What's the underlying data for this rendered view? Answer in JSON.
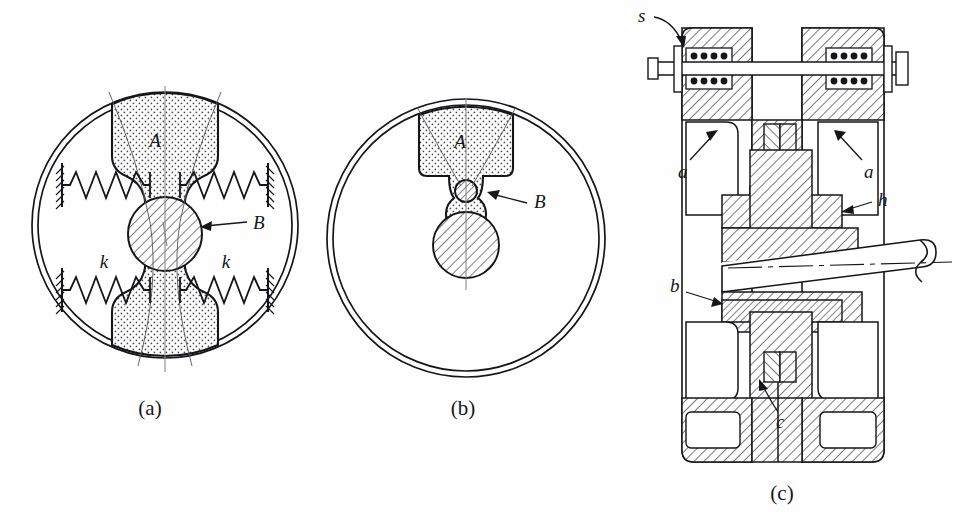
{
  "page": {
    "background_color": "#fefefe",
    "ink_color": "#16161a",
    "stipple_fill_color": "#dedede",
    "hatch_fill_color": "#ffffff"
  },
  "figures": [
    {
      "id": "a",
      "caption": "(a)",
      "description": "Rotor disc with a dumbbell-shaped absorber mass A restrained by four springs k, riding on a hatched shaft hub B",
      "labels": [
        {
          "key": "mass",
          "text": "A",
          "role": "absorber-mass"
        },
        {
          "key": "pivot",
          "text": "B",
          "role": "hub-bearing"
        },
        {
          "key": "spring_left",
          "text": "k",
          "role": "spring-stiffness"
        },
        {
          "key": "spring_right",
          "text": "k",
          "role": "spring-stiffness"
        }
      ],
      "spring_count": 4,
      "spring_coils": 7
    },
    {
      "id": "b",
      "caption": "(b)",
      "description": "Rotor disc with a T-shaped pendulum mass A suspended from pivot pin B above the hatched shaft",
      "labels": [
        {
          "key": "mass",
          "text": "A",
          "role": "pendulum-mass"
        },
        {
          "key": "pivot",
          "text": "B",
          "role": "pivot-pin"
        }
      ]
    },
    {
      "id": "c",
      "caption": "(c)",
      "description": "Sectional assembly drawing of the absorber showing coil springs s, flanges a, hub h, bushing b and clearance c on a tapered shaft",
      "labels": [
        {
          "key": "springs",
          "text": "s",
          "role": "coil-spring"
        },
        {
          "key": "flange_left",
          "text": "a",
          "role": "flange"
        },
        {
          "key": "flange_right",
          "text": "a",
          "role": "flange"
        },
        {
          "key": "hub",
          "text": "h",
          "role": "hub"
        },
        {
          "key": "bushing",
          "text": "b",
          "role": "bushing"
        },
        {
          "key": "clearance",
          "text": "c",
          "role": "clearance-gap"
        }
      ],
      "spring_coil_dots_per_row": 5,
      "spring_rows": 4
    }
  ],
  "captions": {
    "a": "(a)",
    "b": "(b)",
    "c": "(c)"
  },
  "fig_a_labels": {
    "mass": "A",
    "pivot": "B",
    "spring_left": "k",
    "spring_right": "k"
  },
  "fig_b_labels": {
    "mass": "A",
    "pivot": "B"
  },
  "fig_c_labels": {
    "springs": "s",
    "flange_left": "a",
    "flange_right": "a",
    "hub": "h",
    "bushing": "b",
    "clearance": "c"
  }
}
